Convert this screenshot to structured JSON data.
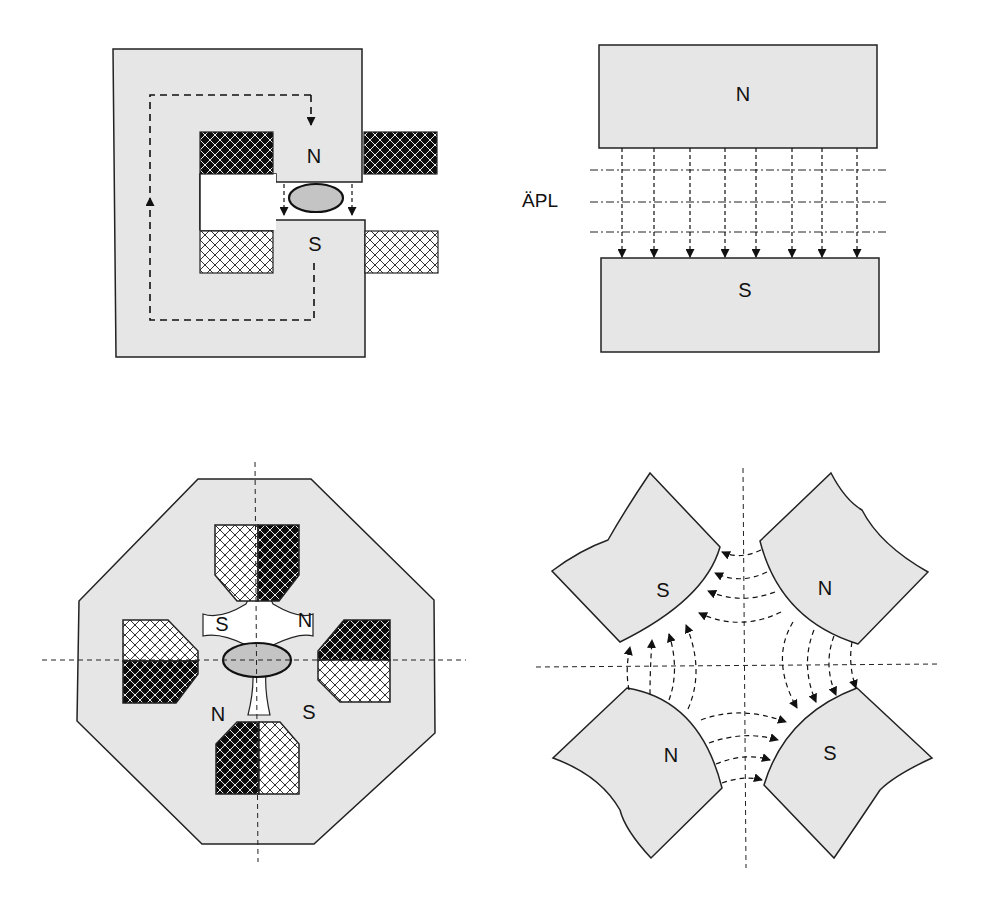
{
  "figure": {
    "panels": [
      {
        "id": "dipole-magnet-yoke",
        "labels": {
          "top_pole": "N",
          "bottom_pole": "S"
        }
      },
      {
        "id": "dipole-field-lines",
        "labels": {
          "top_pole": "N",
          "bottom_pole": "S",
          "side_label": "ÄPL"
        },
        "arrow_count": 8,
        "dashdot_lines": 3
      },
      {
        "id": "quadrupole-magnet-yoke",
        "labels": {
          "top_left": "S",
          "top_right": "N",
          "bottom_left": "N",
          "bottom_right": "S"
        }
      },
      {
        "id": "quadrupole-field-lines",
        "labels": {
          "top_left": "S",
          "top_right": "N",
          "bottom_left": "N",
          "bottom_right": "S"
        }
      }
    ],
    "colors": {
      "iron": "#e6e6e6",
      "beam": "#c4c4c4",
      "coil_dark": "#111111",
      "stroke": "#222222",
      "background": "#ffffff"
    }
  }
}
